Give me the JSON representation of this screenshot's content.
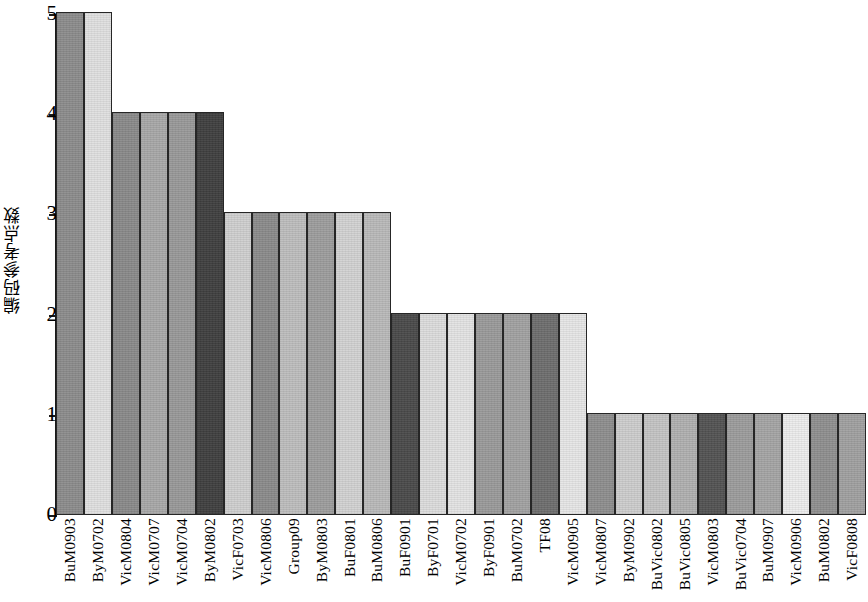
{
  "chart_data": {
    "type": "bar",
    "title": "",
    "xlabel": "",
    "ylabel": "编码参考点数",
    "ylim": [
      0,
      5
    ],
    "ytick_labels": [
      "0",
      "1",
      "2",
      "3",
      "4",
      "5"
    ],
    "yticks": [
      0,
      1,
      2,
      3,
      4,
      5
    ],
    "grid": false,
    "legend": "none",
    "categories": [
      "BuM0903",
      "ByM0702",
      "VicM0804",
      "VicM0707",
      "VicM0704",
      "ByM0802",
      "VicF0703",
      "VicM0806",
      "Group09",
      "ByM0803",
      "BuF0801",
      "BuM0806",
      "BuF0901",
      "ByF0701",
      "VicM0702",
      "ByF0901",
      "BuM0702",
      "TF08",
      "VicM0905",
      "VicM0807",
      "ByM0902",
      "BuVic0802",
      "BuVic0805",
      "VicM0803",
      "BuVic0704",
      "BuM0907",
      "VicM0906",
      "BuM0802",
      "VicF0808"
    ],
    "values": [
      5,
      5,
      4,
      4,
      4,
      4,
      3,
      3,
      3,
      3,
      3,
      3,
      2,
      2,
      2,
      2,
      2,
      2,
      2,
      1,
      1,
      1,
      1,
      1,
      1,
      1,
      1,
      1,
      1
    ],
    "bar_colors": [
      "#8c8c8c",
      "#e0e0e0",
      "#8a8a8a",
      "#a8a8a8",
      "#999999",
      "#3f3f3f",
      "#cfcfcf",
      "#8b8b8b",
      "#bdbdbd",
      "#9d9d9d",
      "#d2d2d2",
      "#b9b9b9",
      "#4a4a4a",
      "#dcdcdc",
      "#e3e3e3",
      "#9a9a9a",
      "#a2a2a2",
      "#6e6e6e",
      "#e6e6e6",
      "#8e8e8e",
      "#cdcdcd",
      "#c4c4c4",
      "#b0b0b0",
      "#535353",
      "#9c9c9c",
      "#a5a5a5",
      "#ececec",
      "#8f8f8f",
      "#a0a0a0"
    ],
    "bar_outline_color": "#262626",
    "axis_color": "#1a1a1a"
  }
}
